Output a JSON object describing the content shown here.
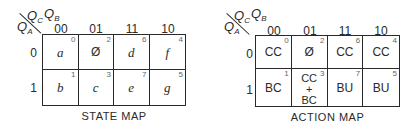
{
  "maps": [
    {
      "title": "STATE MAP",
      "row_variable": "Q",
      "row_variable_sub": "A",
      "col_variables": [
        {
          "name": "Q",
          "sub": "C"
        },
        {
          "name": "Q",
          "sub": "B"
        }
      ],
      "col_labels": [
        "00",
        "01",
        "11",
        "10"
      ],
      "row_labels": [
        "0",
        "1"
      ],
      "cells": [
        [
          {
            "value": "a",
            "index": "0"
          },
          {
            "value": "Ø",
            "index": "2"
          },
          {
            "value": "d",
            "index": "6"
          },
          {
            "value": "f",
            "index": "4"
          }
        ],
        [
          {
            "value": "b",
            "index": "1"
          },
          {
            "value": "c",
            "index": "3"
          },
          {
            "value": "e",
            "index": "7"
          },
          {
            "value": "g",
            "index": "5"
          }
        ]
      ]
    },
    {
      "title": "ACTION MAP",
      "row_variable": "Q",
      "row_variable_sub": "A",
      "col_variables": [
        {
          "name": "Q",
          "sub": "C"
        },
        {
          "name": "Q",
          "sub": "B"
        }
      ],
      "col_labels": [
        "00",
        "01",
        "11",
        "10"
      ],
      "row_labels": [
        "0",
        "1"
      ],
      "cells": [
        [
          {
            "value": "CC",
            "index": "0"
          },
          {
            "value": "Ø",
            "index": "2"
          },
          {
            "value": "CC",
            "index": "6"
          },
          {
            "value": "CC",
            "index": "4"
          }
        ],
        [
          {
            "value": "BC",
            "index": "1"
          },
          {
            "lines": [
              "CC",
              "+",
              "BC"
            ],
            "index": "3"
          },
          {
            "value": "BU",
            "index": "7"
          },
          {
            "value": "BU",
            "index": "5"
          }
        ]
      ]
    }
  ]
}
